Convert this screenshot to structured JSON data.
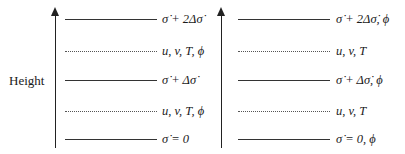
{
  "axis_label": "Height",
  "colors": {
    "axis": "#222222",
    "solid_line": "#333333",
    "dotted_line": "#555555",
    "text": "#1a1a1a",
    "background": "#ffffff"
  },
  "left_column": {
    "levels": [
      {
        "type": "solid",
        "label": "σ̇ + 2Δσ̇"
      },
      {
        "type": "dotted",
        "label": "u, v, T, ϕ"
      },
      {
        "type": "solid",
        "label": "σ̇ + Δσ̇"
      },
      {
        "type": "dotted",
        "label": "u, v, T, ϕ"
      },
      {
        "type": "solid",
        "label": "σ̇ = 0"
      }
    ]
  },
  "right_column": {
    "levels": [
      {
        "type": "solid",
        "label": "σ̇ + 2Δσ̇, ϕ"
      },
      {
        "type": "dotted",
        "label": "u, v, T"
      },
      {
        "type": "solid",
        "label": "σ̇ + Δσ̇, ϕ"
      },
      {
        "type": "dotted",
        "label": "u, v, T"
      },
      {
        "type": "solid",
        "label": "σ̇ = 0, ϕ"
      }
    ]
  }
}
